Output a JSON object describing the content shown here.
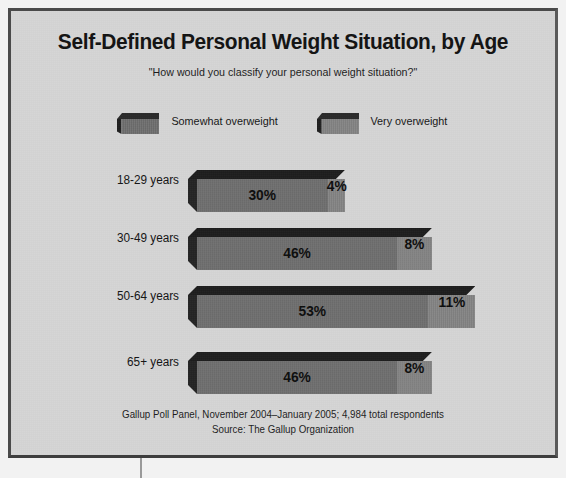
{
  "chart_data": {
    "type": "bar",
    "orientation": "horizontal",
    "stacked": true,
    "title": "Self-Defined Personal Weight Situation, by Age",
    "subtitle": "\"How would you classify your personal weight situation?\"",
    "xlabel": "",
    "ylabel": "",
    "categories": [
      "18-29 years",
      "30-49 years",
      "50-64 years",
      "65+ years"
    ],
    "series": [
      {
        "name": "Somewhat overweight",
        "values": [
          30,
          46,
          53,
          46
        ],
        "labels": [
          "30%",
          "46%",
          "53%",
          "46%"
        ],
        "color": "#6e6e6e"
      },
      {
        "name": "Very overweight",
        "values": [
          4,
          8,
          11,
          8
        ],
        "labels": [
          "4%",
          "8%",
          "11%",
          "8%"
        ],
        "color": "#848484"
      }
    ],
    "totals": [
      34,
      54,
      64,
      54
    ],
    "unit": "percent",
    "xlim": [
      0,
      64
    ],
    "grid": false,
    "legend_position": "top"
  },
  "legend": {
    "items": [
      {
        "label": "Somewhat overweight",
        "swatch_name": "legend-swatch-somewhat"
      },
      {
        "label": "Very overweight",
        "swatch_name": "legend-swatch-very"
      }
    ]
  },
  "footer": {
    "line1": "Gallup Poll Panel, November 2004–January 2005; 4,984 total respondents",
    "line2": "Source: The Gallup Organization"
  },
  "style": {
    "background": "#d6d6d6",
    "border": "#4a4a4a",
    "text": "#131313"
  }
}
